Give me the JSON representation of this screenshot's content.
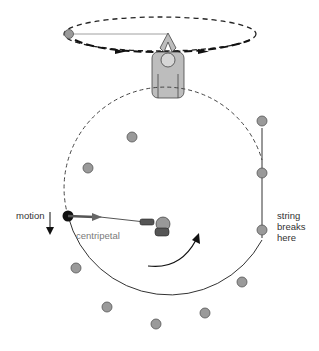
{
  "diagram": {
    "top_scene": {
      "description": "person whirling ball on string overhead in horizontal circle",
      "path_style": "dashed ellipse with arrows"
    },
    "labels": {
      "motion": "motion",
      "centripetal_line1": "centripetal",
      "centripetal_line2": "force",
      "string_line1": "string",
      "string_line2": "breaks",
      "string_line3": "here"
    },
    "colors": {
      "ball_fill": "#9a9a9a",
      "ball_stroke": "#555555",
      "active_ball": "#111111",
      "path": "#333333",
      "force_arrow": "#666666",
      "label_text": "#333333",
      "force_text": "#7a7a7a"
    }
  }
}
